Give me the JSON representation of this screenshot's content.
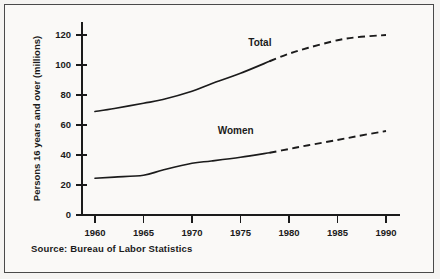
{
  "figure": {
    "source_note": "Source: Bureau of Labor Statistics",
    "background_color": "#faf9f7",
    "border_color": "#4a4a4a",
    "ink_color": "#1b1b1b"
  },
  "chart_data": {
    "type": "line",
    "title": "",
    "subtitle": "",
    "xlabel": "",
    "ylabel": "Persons 16 years and over (millions)",
    "xlim": [
      1958,
      1992
    ],
    "ylim": [
      0,
      128
    ],
    "xticks": [
      1960,
      1965,
      1970,
      1975,
      1980,
      1985,
      1990
    ],
    "xtick_labels": [
      "1960",
      "1965",
      "1970",
      "1975",
      "1980",
      "1985",
      "1990"
    ],
    "yticks": [
      0,
      20,
      40,
      60,
      80,
      100,
      120
    ],
    "ytick_labels": [
      "0",
      "20",
      "40",
      "60",
      "80",
      "100",
      "120"
    ],
    "grid": false,
    "legend": "inline-labels",
    "projection_start_year": 1978,
    "annotations": [
      {
        "text": "Total",
        "x": 1977,
        "y": 113
      },
      {
        "text": "Women",
        "x": 1974.5,
        "y": 54
      }
    ],
    "series": [
      {
        "name": "Total",
        "label": "Total",
        "style_actual": "solid",
        "style_projected": "dashed",
        "x": [
          1960,
          1962,
          1965,
          1967,
          1970,
          1972,
          1975,
          1978,
          1980,
          1982,
          1985,
          1987,
          1990
        ],
        "values": [
          69,
          71,
          74.5,
          77,
          82.5,
          87.5,
          94.5,
          102.5,
          107.5,
          111.5,
          116.5,
          118.5,
          120
        ]
      },
      {
        "name": "Women",
        "label": "Women",
        "style_actual": "solid",
        "style_projected": "dashed",
        "x": [
          1960,
          1962,
          1965,
          1967,
          1970,
          1972,
          1975,
          1978,
          1980,
          1982,
          1985,
          1987,
          1990
        ],
        "values": [
          24.5,
          25.3,
          26.5,
          30,
          34.5,
          36,
          38.5,
          41.5,
          44,
          46.5,
          50,
          52.5,
          56
        ]
      }
    ]
  }
}
